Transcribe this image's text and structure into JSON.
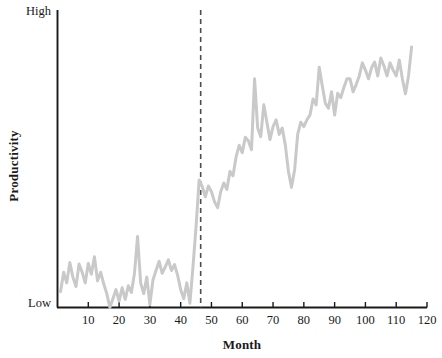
{
  "figure": {
    "background_color": "#ffffff",
    "axis_color": "#1a1a1a",
    "series_color": "#c9c9c9",
    "intervention_color": "#4d4d4d"
  },
  "axes": {
    "y_label": "Productivity",
    "x_label": "Month",
    "y_tick_high": "High",
    "y_tick_low": "Low",
    "x_tick_labels": [
      "10",
      "20",
      "30",
      "40",
      "50",
      "60",
      "70",
      "80",
      "90",
      "100",
      "110",
      "120"
    ]
  },
  "chart_data": {
    "type": "line",
    "title": "",
    "subtitle": "",
    "xlabel": "Month",
    "ylabel": "Productivity",
    "xlim": [
      0,
      120
    ],
    "ylim": [
      0,
      1
    ],
    "ytick_labels": [
      "Low",
      "High"
    ],
    "ytick_values": [
      0,
      1
    ],
    "xtick_values": [
      10,
      20,
      30,
      40,
      50,
      60,
      70,
      80,
      90,
      100,
      110,
      120
    ],
    "grid": false,
    "legend": null,
    "legend_position": "none",
    "annotations": [
      {
        "type": "vertical-dashed-line",
        "name": "intervention-line",
        "x": 46.5,
        "label": ""
      }
    ],
    "series": [
      {
        "name": "Productivity",
        "color": "#c9c9c9",
        "x": [
          1,
          2,
          3,
          4,
          5,
          6,
          7,
          8,
          9,
          10,
          11,
          12,
          13,
          14,
          15,
          16,
          17,
          18,
          19,
          20,
          21,
          22,
          23,
          24,
          25,
          26,
          27,
          28,
          29,
          30,
          31,
          32,
          33,
          34,
          35,
          36,
          37,
          38,
          39,
          40,
          41,
          42,
          43,
          44,
          45,
          46,
          47,
          48,
          49,
          50,
          51,
          52,
          53,
          54,
          55,
          56,
          57,
          58,
          59,
          60,
          61,
          62,
          63,
          64,
          65,
          66,
          67,
          68,
          69,
          70,
          71,
          72,
          73,
          74,
          75,
          76,
          77,
          78,
          79,
          80,
          81,
          82,
          83,
          84,
          85,
          86,
          87,
          88,
          89,
          90,
          91,
          92,
          93,
          94,
          95,
          96,
          97,
          98,
          99,
          100,
          101,
          102,
          103,
          104,
          105,
          106,
          107,
          108,
          109,
          110,
          111,
          112,
          113,
          114,
          115
        ],
        "values": [
          0.055,
          0.122,
          0.085,
          0.155,
          0.105,
          0.072,
          0.15,
          0.122,
          0.085,
          0.152,
          0.115,
          0.175,
          0.092,
          0.122,
          0.082,
          0.048,
          0.0,
          0.03,
          0.062,
          0.022,
          0.068,
          0.028,
          0.075,
          0.052,
          0.118,
          0.245,
          0.085,
          0.048,
          0.105,
          0.01,
          0.095,
          0.128,
          0.16,
          0.118,
          0.14,
          0.165,
          0.128,
          0.148,
          0.112,
          0.062,
          0.03,
          0.085,
          0.015,
          0.14,
          0.28,
          0.44,
          0.418,
          0.382,
          0.42,
          0.4,
          0.365,
          0.345,
          0.4,
          0.43,
          0.408,
          0.47,
          0.455,
          0.52,
          0.56,
          0.535,
          0.588,
          0.575,
          0.545,
          0.79,
          0.62,
          0.59,
          0.7,
          0.64,
          0.58,
          0.625,
          0.648,
          0.598,
          0.62,
          0.56,
          0.47,
          0.415,
          0.475,
          0.598,
          0.64,
          0.625,
          0.648,
          0.665,
          0.72,
          0.7,
          0.83,
          0.765,
          0.705,
          0.688,
          0.745,
          0.665,
          0.74,
          0.725,
          0.76,
          0.79,
          0.79,
          0.745,
          0.77,
          0.8,
          0.845,
          0.82,
          0.79,
          0.828,
          0.848,
          0.8,
          0.862,
          0.835,
          0.8,
          0.845,
          0.82,
          0.8,
          0.855,
          0.79,
          0.738,
          0.8,
          0.9
        ]
      }
    ]
  }
}
